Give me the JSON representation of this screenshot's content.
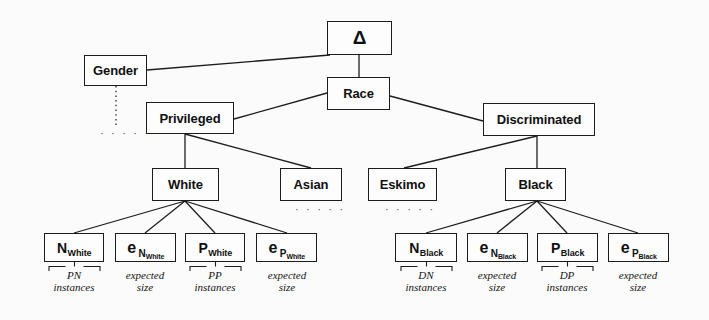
{
  "diagram": {
    "root": {
      "label": "Δ",
      "name": "delta"
    },
    "nodes": [
      {
        "id": "delta",
        "label": "Δ",
        "x": 327,
        "y": 21,
        "w": 65,
        "h": 34,
        "kind": "root"
      },
      {
        "id": "gender",
        "label": "Gender",
        "x": 84,
        "y": 55,
        "w": 63,
        "h": 31,
        "kind": "concept"
      },
      {
        "id": "race",
        "label": "Race",
        "x": 327,
        "y": 77,
        "w": 63,
        "h": 33,
        "kind": "concept"
      },
      {
        "id": "privileged",
        "label": "Privileged",
        "x": 146,
        "y": 102,
        "w": 88,
        "h": 32,
        "kind": "concept"
      },
      {
        "id": "discriminated",
        "label": "Discriminated",
        "x": 483,
        "y": 103,
        "w": 112,
        "h": 33,
        "kind": "concept"
      },
      {
        "id": "white",
        "label": "White",
        "x": 152,
        "y": 168,
        "w": 67,
        "h": 33,
        "kind": "concept"
      },
      {
        "id": "asian",
        "label": "Asian",
        "x": 280,
        "y": 168,
        "w": 62,
        "h": 33,
        "kind": "concept"
      },
      {
        "id": "eskimo",
        "label": "Eskimo",
        "x": 368,
        "y": 168,
        "w": 69,
        "h": 33,
        "kind": "concept"
      },
      {
        "id": "black",
        "label": "Black",
        "x": 505,
        "y": 168,
        "w": 61,
        "h": 33,
        "kind": "concept"
      }
    ],
    "leaves": [
      {
        "id": "n-white",
        "base": "N",
        "sub": "White",
        "subsub": "",
        "x": 44,
        "y": 233,
        "w": 60,
        "h": 29,
        "style": "plain"
      },
      {
        "id": "e-n-white",
        "base": "e",
        "sub": "N",
        "subsub": "White",
        "x": 115,
        "y": 233,
        "w": 61,
        "h": 29,
        "style": "ebox"
      },
      {
        "id": "p-white",
        "base": "P",
        "sub": "White",
        "subsub": "",
        "x": 185,
        "y": 233,
        "w": 60,
        "h": 29,
        "style": "plain"
      },
      {
        "id": "e-p-white",
        "base": "e",
        "sub": "P",
        "subsub": "White",
        "x": 256,
        "y": 233,
        "w": 61,
        "h": 29,
        "style": "ebox"
      },
      {
        "id": "n-black",
        "base": "N",
        "sub": "Black",
        "subsub": "",
        "x": 395,
        "y": 233,
        "w": 62,
        "h": 29,
        "style": "plain"
      },
      {
        "id": "e-n-black",
        "base": "e",
        "sub": "N",
        "subsub": "Black",
        "x": 467,
        "y": 233,
        "w": 61,
        "h": 29,
        "style": "ebox"
      },
      {
        "id": "p-black",
        "base": "P",
        "sub": "Black",
        "subsub": "",
        "x": 537,
        "y": 233,
        "w": 61,
        "h": 29,
        "style": "plain"
      },
      {
        "id": "e-p-black",
        "base": "e",
        "sub": "P",
        "subsub": "Black",
        "x": 608,
        "y": 233,
        "w": 61,
        "h": 29,
        "style": "ebox"
      }
    ],
    "captions": [
      {
        "id": "cap-pn",
        "line1": "PN",
        "line2": "instances",
        "cx": 74,
        "y": 269,
        "brace": true,
        "bx": 49,
        "bw": 51
      },
      {
        "id": "cap-exp-nw",
        "line1": "expected",
        "line2": "size",
        "cx": 145,
        "y": 269,
        "brace": false,
        "bx": 0,
        "bw": 0
      },
      {
        "id": "cap-pp",
        "line1": "PP",
        "line2": "instances",
        "cx": 215,
        "y": 269,
        "brace": true,
        "bx": 190,
        "bw": 51
      },
      {
        "id": "cap-exp-pw",
        "line1": "expected",
        "line2": "size",
        "cx": 287,
        "y": 269,
        "brace": false,
        "bx": 0,
        "bw": 0
      },
      {
        "id": "cap-dn",
        "line1": "DN",
        "line2": "instances",
        "cx": 426,
        "y": 269,
        "brace": true,
        "bx": 401,
        "bw": 51
      },
      {
        "id": "cap-exp-nb",
        "line1": "expected",
        "line2": "size",
        "cx": 497,
        "y": 269,
        "brace": false,
        "bx": 0,
        "bw": 0
      },
      {
        "id": "cap-dp",
        "line1": "DP",
        "line2": "instances",
        "cx": 567,
        "y": 269,
        "brace": true,
        "bx": 542,
        "bw": 51
      },
      {
        "id": "cap-exp-pb",
        "line1": "expected",
        "line2": "size",
        "cx": 638,
        "y": 269,
        "brace": false,
        "bx": 0,
        "bw": 0
      }
    ],
    "ellipses": [
      {
        "id": "ellipsis-gender",
        "text": "· · · · ·",
        "x": 100,
        "y": 128
      },
      {
        "id": "ellipsis-asian",
        "text": "· · · · ·",
        "x": 295,
        "y": 204
      },
      {
        "id": "ellipsis-eskimo",
        "text": "· · · · ·",
        "x": 385,
        "y": 204
      }
    ],
    "edges": [
      {
        "id": "edge-delta-gender",
        "from": "delta",
        "to": "gender",
        "x1": 330,
        "y1": 55,
        "x2": 147,
        "y2": 70
      },
      {
        "id": "edge-delta-race",
        "from": "delta",
        "to": "race",
        "x1": 359,
        "y1": 55,
        "x2": 359,
        "y2": 77
      },
      {
        "id": "edge-race-privileged",
        "from": "race",
        "to": "privileged",
        "x1": 327,
        "y1": 93,
        "x2": 234,
        "y2": 119
      },
      {
        "id": "edge-race-discriminated",
        "from": "race",
        "to": "discriminated",
        "x1": 390,
        "y1": 96,
        "x2": 483,
        "y2": 121
      },
      {
        "id": "edge-privileged-white",
        "from": "privileged",
        "to": "white",
        "x1": 185,
        "y1": 134,
        "x2": 185,
        "y2": 168
      },
      {
        "id": "edge-privileged-asian",
        "from": "privileged",
        "to": "asian",
        "x1": 185,
        "y1": 134,
        "x2": 311,
        "y2": 168
      },
      {
        "id": "edge-discriminated-eskimo",
        "from": "discriminated",
        "to": "eskimo",
        "x1": 537,
        "y1": 136,
        "x2": 404,
        "y2": 168
      },
      {
        "id": "edge-discriminated-black",
        "from": "discriminated",
        "to": "black",
        "x1": 537,
        "y1": 136,
        "x2": 537,
        "y2": 168
      },
      {
        "id": "edge-white-nwhite",
        "from": "white",
        "to": "n-white",
        "x1": 185,
        "y1": 201,
        "x2": 74,
        "y2": 233
      },
      {
        "id": "edge-white-enwhite",
        "from": "white",
        "to": "e-n-white",
        "x1": 185,
        "y1": 201,
        "x2": 145,
        "y2": 233
      },
      {
        "id": "edge-white-pwhite",
        "from": "white",
        "to": "p-white",
        "x1": 185,
        "y1": 201,
        "x2": 215,
        "y2": 233
      },
      {
        "id": "edge-white-epwhite",
        "from": "white",
        "to": "e-p-white",
        "x1": 185,
        "y1": 201,
        "x2": 287,
        "y2": 233
      },
      {
        "id": "edge-black-nblack",
        "from": "black",
        "to": "n-black",
        "x1": 537,
        "y1": 201,
        "x2": 426,
        "y2": 233
      },
      {
        "id": "edge-black-enblack",
        "from": "black",
        "to": "e-n-black",
        "x1": 537,
        "y1": 201,
        "x2": 497,
        "y2": 233
      },
      {
        "id": "edge-black-pblack",
        "from": "black",
        "to": "p-black",
        "x1": 537,
        "y1": 201,
        "x2": 567,
        "y2": 233
      },
      {
        "id": "edge-black-epblack",
        "from": "black",
        "to": "e-p-black",
        "x1": 537,
        "y1": 201,
        "x2": 638,
        "y2": 233
      }
    ],
    "dotted_edges": [
      {
        "id": "edge-gender-unknown",
        "x1": 116,
        "y1": 86,
        "x2": 116,
        "y2": 126
      }
    ],
    "colors": {
      "stroke": "#1c1c1c",
      "box_fill": "#fdfdfd",
      "text": "#101010",
      "background": "#fbfbfb"
    }
  }
}
